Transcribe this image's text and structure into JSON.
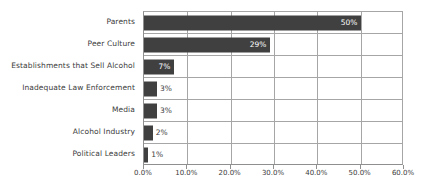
{
  "chart_data": {
    "type": "bar",
    "orientation": "horizontal",
    "title": "",
    "xlabel": "",
    "ylabel": "",
    "categories": [
      "Parents",
      "Peer Culture",
      "Establishments that Sell Alcohol",
      "Inadequate Law Enforcement",
      "Media",
      "Alcohol Industry",
      "Political Leaders"
    ],
    "values": [
      50,
      29,
      7,
      3,
      3,
      2,
      1
    ],
    "data_labels": [
      "50%",
      "29%",
      "7%",
      "3%",
      "3%",
      "2%",
      "1%"
    ],
    "xlim": [
      0,
      60
    ],
    "xtick_values": [
      0,
      10,
      20,
      30,
      40,
      50,
      60
    ],
    "xtick_labels": [
      "0.0%",
      "10.0%",
      "20.0%",
      "30.0%",
      "40.0%",
      "50.0%",
      "60.0%"
    ],
    "grid": true,
    "legend": false,
    "bar_color": "#404040",
    "grid_color": "#a6a6a6",
    "label_inside_color": "#ffffff",
    "label_outside_color": "#3b3b3b"
  }
}
